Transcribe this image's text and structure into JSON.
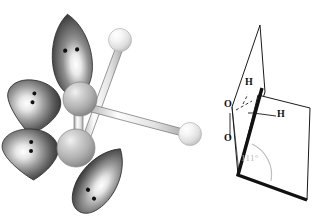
{
  "figure": {
    "background_color": "#ffffff",
    "width": 334,
    "height": 217
  },
  "panels": [
    {
      "id": "orbital-model",
      "name": "orbital-lone-pair-model",
      "description": "Ball-and-orbital model of H2O2 with sp3 hybrid lobes and lone pairs",
      "atoms": [
        {
          "element": "O",
          "label": "",
          "cx": 80,
          "cy": 99,
          "r": 17,
          "color": "#b4b4b4",
          "name": "oxygen-upper"
        },
        {
          "element": "O",
          "label": "",
          "cx": 76,
          "cy": 148,
          "r": 19,
          "color": "#b0b0b0",
          "name": "oxygen-lower"
        },
        {
          "element": "H",
          "label": "",
          "cx": 120,
          "cy": 40,
          "r": 11,
          "color": "#e8e8e8",
          "name": "hydrogen-upper"
        },
        {
          "element": "H",
          "label": "",
          "cx": 190,
          "cy": 134,
          "r": 11,
          "color": "#e3e3e3",
          "name": "hydrogen-lower"
        }
      ],
      "lobes": [
        {
          "name": "lobe-top",
          "lone_pair_dots": 2,
          "cx": 70,
          "cy": 55,
          "angle": -82
        },
        {
          "name": "lobe-upper-left",
          "lone_pair_dots": 2,
          "cx": 34,
          "cy": 105,
          "angle": 196
        },
        {
          "name": "lobe-lower-left",
          "lone_pair_dots": 2,
          "cx": 32,
          "cy": 152,
          "angle": 183
        },
        {
          "name": "lobe-bottom-right",
          "lone_pair_dots": 2,
          "cx": 98,
          "cy": 182,
          "angle": 57
        }
      ],
      "bonds": [
        {
          "name": "bond-o-o",
          "from": "oxygen-upper",
          "to": "oxygen-lower",
          "style": "cylinder"
        },
        {
          "name": "bond-o-h-upper",
          "from": "oxygen-lower",
          "to": "hydrogen-upper",
          "style": "cylinder"
        },
        {
          "name": "bond-o-h-lower",
          "from": "oxygen-upper",
          "to": "hydrogen-lower",
          "style": "cylinder"
        }
      ]
    },
    {
      "id": "dihedral-diagram",
      "name": "dihedral-angle-diagram",
      "description": "Two intersecting planes showing the O-O-H bond angle",
      "labels": {
        "h_upper": "H",
        "h_lower": "H",
        "o_upper": "O",
        "o_lower": "O",
        "angle": "111°"
      },
      "angle_value": 111,
      "angle_unit": "degrees",
      "angle_color": "#b9b9b9",
      "plane_stroke": "#1a1a1a",
      "plane_fill": "#ffffff"
    }
  ]
}
